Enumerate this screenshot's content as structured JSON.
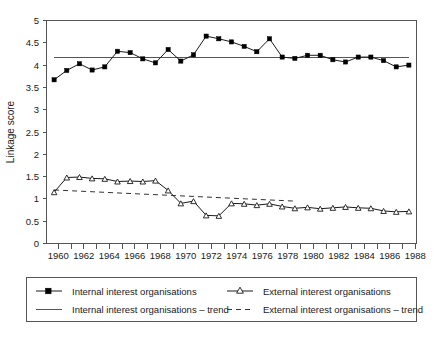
{
  "chart_data": {
    "type": "line",
    "title": "",
    "xlabel": "",
    "ylabel": "Linkage score",
    "xlim": [
      1959.4,
      1988.6
    ],
    "ylim": [
      0,
      5
    ],
    "ytick_step": 0.5,
    "yticks": [
      "0",
      "0.5",
      "1",
      "1.5",
      "2",
      "2.5",
      "3",
      "3.5",
      "4",
      "4.5",
      "5"
    ],
    "xticks": [
      "1960",
      "1962",
      "1964",
      "1966",
      "1968",
      "1970",
      "1972",
      "1974",
      "1976",
      "1978",
      "1980",
      "1982",
      "1984",
      "1986",
      "1988"
    ],
    "xtick_minor_step": 1,
    "grid": false,
    "legend_position": "below-plot",
    "x": [
      1960,
      1961,
      1962,
      1963,
      1964,
      1965,
      1966,
      1967,
      1968,
      1969,
      1970,
      1971,
      1972,
      1973,
      1974,
      1975,
      1976,
      1977,
      1978,
      1979,
      1980,
      1981,
      1982,
      1983,
      1984,
      1985,
      1986,
      1987,
      1988
    ],
    "series": [
      {
        "name": "Internal interest organisations",
        "marker": "filled-square",
        "values": [
          3.67,
          3.88,
          4.03,
          3.89,
          3.96,
          4.31,
          4.28,
          4.14,
          4.05,
          4.35,
          4.09,
          4.23,
          4.65,
          4.59,
          4.52,
          4.42,
          4.3,
          4.59,
          4.18,
          4.15,
          4.22,
          4.22,
          4.12,
          4.07,
          4.18,
          4.18,
          4.1,
          3.96,
          4.0
        ]
      },
      {
        "name": "External interest organisations",
        "marker": "open-triangle",
        "values": [
          1.15,
          1.48,
          1.49,
          1.46,
          1.45,
          1.39,
          1.4,
          1.39,
          1.41,
          1.19,
          0.9,
          0.95,
          0.63,
          0.62,
          0.9,
          0.89,
          0.86,
          0.89,
          0.83,
          0.79,
          0.81,
          0.78,
          0.8,
          0.82,
          0.8,
          0.79,
          0.73,
          0.71,
          0.72
        ]
      }
    ],
    "trends": [
      {
        "name": "Internal interest organisations – trend",
        "style": "solid",
        "x": [
          1960,
          1988
        ],
        "values": [
          4.17,
          4.17
        ]
      },
      {
        "name": "External interest organisations – trend",
        "style": "dashed",
        "x": [
          1960,
          1979
        ],
        "values": [
          1.2,
          0.95
        ]
      }
    ],
    "legend": [
      {
        "label": "Internal interest organisations",
        "marker": "filled-square",
        "style": "solid"
      },
      {
        "label": "External interest organisations",
        "marker": "open-triangle",
        "style": "solid"
      },
      {
        "label": "Internal interest organisations – trend",
        "marker": "none",
        "style": "solid"
      },
      {
        "label": "External interest organisations – trend",
        "marker": "none",
        "style": "dashed"
      }
    ],
    "colors": {
      "series_internal": "#000000",
      "series_external": "#1a1a1a",
      "axis": "#555555",
      "background": "#ffffff"
    }
  }
}
